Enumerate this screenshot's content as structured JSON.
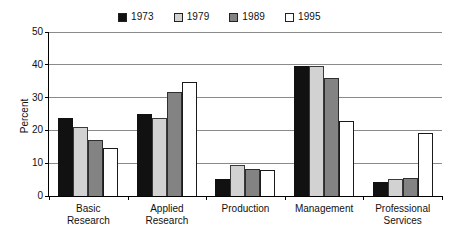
{
  "chart_data": {
    "type": "bar",
    "title": "",
    "xlabel": "",
    "ylabel": "Percent",
    "ylim": [
      0,
      50
    ],
    "yticks": [
      0,
      10,
      20,
      30,
      40,
      50
    ],
    "ytick_labels": [
      "0",
      "10",
      "20",
      "30",
      "40",
      "50"
    ],
    "grid": true,
    "legend_position": "top-center",
    "categories": [
      "Basic Research",
      "Applied Research",
      "Production",
      "Management",
      "Professional Services"
    ],
    "category_lines": [
      [
        "Basic",
        "Research"
      ],
      [
        "Applied",
        "Research"
      ],
      [
        "Production",
        ""
      ],
      [
        "Management",
        ""
      ],
      [
        "Professional",
        "Services"
      ]
    ],
    "series": [
      {
        "name": "1973",
        "color": "#111111",
        "values": [
          23.8,
          25.0,
          5.2,
          39.6,
          4.4
        ]
      },
      {
        "name": "1979",
        "color": "#d2d2d2",
        "values": [
          21.0,
          23.9,
          9.5,
          39.5,
          5.1
        ]
      },
      {
        "name": "1989",
        "color": "#838383",
        "values": [
          17.2,
          31.8,
          8.1,
          36.1,
          5.4
        ]
      },
      {
        "name": "1995",
        "color": "#ffffff",
        "values": [
          14.6,
          34.8,
          8.0,
          23.0,
          19.2
        ]
      }
    ]
  },
  "legend": {
    "items": [
      {
        "label": "1973",
        "color": "#111111"
      },
      {
        "label": "1979",
        "color": "#d2d2d2"
      },
      {
        "label": "1989",
        "color": "#838383"
      },
      {
        "label": "1995",
        "color": "#ffffff"
      }
    ]
  }
}
